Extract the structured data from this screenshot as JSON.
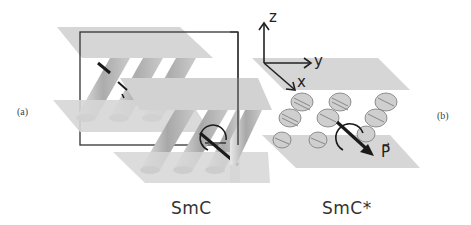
{
  "figure": {
    "panels": [
      {
        "id": "a",
        "label": "(a)",
        "phase": "SmC"
      },
      {
        "id": "b",
        "label": "(b)",
        "phase": "SmC*"
      }
    ],
    "axes": {
      "z": "z",
      "y": "y",
      "x": "x"
    },
    "polarization_label": "P⃗",
    "colors": {
      "plane": "#d4d4d4",
      "frame": "#333333",
      "arrow": "#1a1a1a",
      "text": "#333333"
    }
  }
}
